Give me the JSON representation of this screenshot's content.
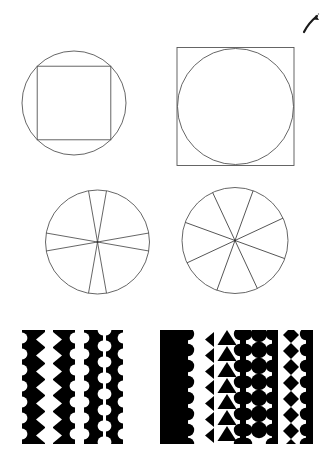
{
  "page": {
    "background_color": "#ffffff",
    "ink_color": "#000000",
    "outline_color": "#555555",
    "width": 325,
    "height": 473
  },
  "annotation": {
    "name": "hand-drawn-check-mark",
    "description": "small ink caret stroke at top right corner",
    "x": 305,
    "y": 18,
    "color": "#1a1a1a"
  },
  "figures": [
    {
      "id": "fig-1",
      "label": "square inscribed in circle",
      "row": 1,
      "column": 1,
      "type": "outline",
      "shapes": [
        "circle",
        "square"
      ],
      "relation": "square-inside-circle",
      "circle": {
        "cx": 74,
        "cy": 103,
        "r": 52
      },
      "square": {
        "x": 36,
        "y": 65,
        "size": 76
      }
    },
    {
      "id": "fig-2",
      "label": "circle inscribed in square",
      "row": 1,
      "column": 2,
      "type": "outline",
      "shapes": [
        "square",
        "circle"
      ],
      "relation": "circle-inside-square",
      "square": {
        "x": 177,
        "y": 47,
        "size": 117
      },
      "circle": {
        "cx": 235,
        "cy": 106,
        "r": 58
      }
    },
    {
      "id": "fig-3",
      "label": "circle divided into eight sectors, axis aligned",
      "row": 2,
      "column": 1,
      "type": "pie-outline",
      "sectors": 8,
      "rotation_degrees": 0,
      "spoke_angles": [
        10,
        55,
        80,
        125,
        190,
        235,
        260,
        305
      ],
      "circle": {
        "cx": 97,
        "cy": 242,
        "r": 52
      }
    },
    {
      "id": "fig-4",
      "label": "circle divided into eight sectors, rotated",
      "row": 2,
      "column": 2,
      "type": "pie-outline",
      "sectors": 8,
      "rotation_degrees": 22.5,
      "spoke_angles": [
        22,
        67,
        112,
        157,
        202,
        247,
        292,
        337
      ],
      "circle": {
        "cx": 235,
        "cy": 240,
        "r": 53
      }
    },
    {
      "id": "fig-5",
      "label": "white shapes between black scalloped strips",
      "row": 3,
      "column": 1,
      "type": "figure-ground",
      "background": "#ffffff",
      "ink": "#000000",
      "bounds": {
        "x": 22,
        "y": 330,
        "width": 100,
        "height": 113
      },
      "strip_count": 4,
      "gap_contents": [
        "triangles",
        "circles",
        "none"
      ],
      "repeat_units": 7
    },
    {
      "id": "fig-6",
      "label": "black shapes inside white channels on black field",
      "row": 3,
      "column": 2,
      "type": "figure-ground-reversed",
      "background": "#000000",
      "ink": "#ffffff",
      "bounds": {
        "x": 160,
        "y": 330,
        "width": 153,
        "height": 113
      },
      "strip_count": 5,
      "gap_contents": [
        "triangles",
        "circles",
        "diamonds",
        "none"
      ],
      "repeat_units": 7
    }
  ]
}
